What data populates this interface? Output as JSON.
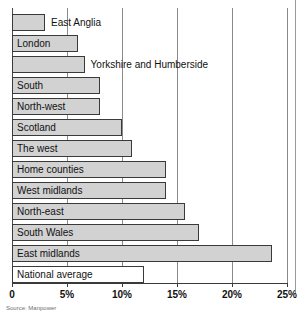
{
  "chart_data": {
    "type": "bar",
    "orientation": "horizontal",
    "title": "",
    "xlabel": "",
    "ylabel": "",
    "xlim": [
      0,
      25
    ],
    "grid": true,
    "legend": false,
    "source": "Source: Manpower",
    "xticks": [
      "0",
      "5%",
      "10%",
      "15%",
      "20%",
      "25%"
    ],
    "xtick_values": [
      0,
      5,
      10,
      15,
      20,
      25
    ],
    "categories": [
      "East Anglia",
      "London",
      "Yorkshire and Humberside",
      "South",
      "North-west",
      "Scotland",
      "The west",
      "Home counties",
      "West midlands",
      "North-east",
      "South Wales",
      "East midlands",
      "National average"
    ],
    "values": [
      3.0,
      6.0,
      6.6,
      8.0,
      8.0,
      10.0,
      10.9,
      14.0,
      14.0,
      15.7,
      17.0,
      23.6,
      12.0
    ],
    "label_placement": [
      "outside",
      "inside",
      "outside",
      "inside",
      "inside",
      "inside",
      "inside",
      "inside",
      "inside",
      "inside",
      "inside",
      "inside",
      "inside"
    ],
    "bar_style": [
      "filled",
      "filled",
      "filled",
      "filled",
      "filled",
      "filled",
      "filled",
      "filled",
      "filled",
      "filled",
      "filled",
      "filled",
      "unfilled"
    ],
    "colors": {
      "bar_fill": "#d2d2d2",
      "bar_fill_unfilled": "#ffffff",
      "bar_border": "#3a3a3a",
      "gridline": "#8a8a8a",
      "axis": "#3a3a3a",
      "text": "#111111",
      "source_text": "#707070",
      "background": "#ffffff"
    }
  }
}
